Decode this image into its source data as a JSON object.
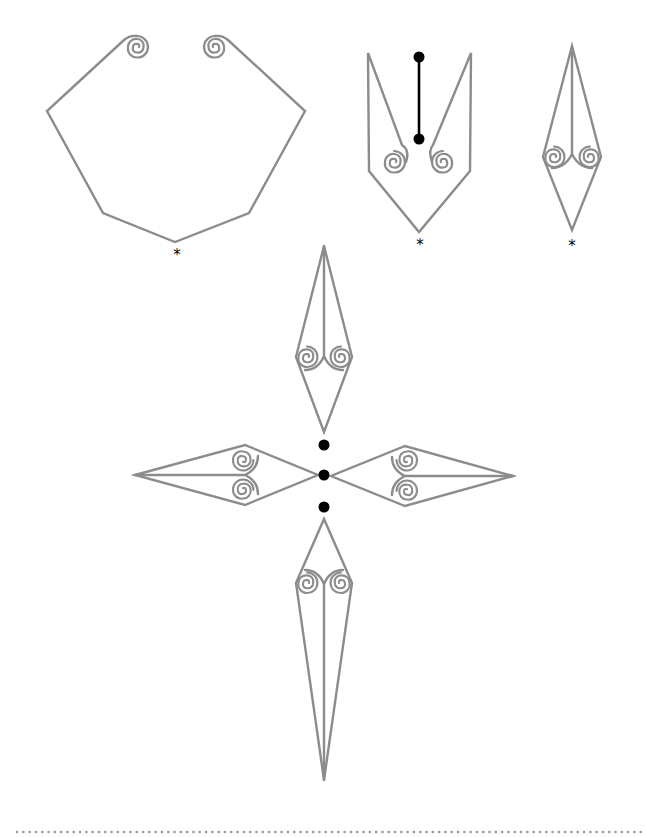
{
  "diagram": {
    "title": "",
    "stroke_color": "#8c8c8c",
    "dot_color": "#000000",
    "markers": {
      "fold_point_symbol": "*"
    },
    "figures": [
      {
        "id": "hexagon-with-scrolls",
        "label": "*",
        "description": "Open heptagonal outline with two inward spirals at the top"
      },
      {
        "id": "v-shape-with-scrolls",
        "label": "*",
        "description": "V-shaped outline with two spirals and a black pin line with dots"
      },
      {
        "id": "diamond-with-scrolls",
        "label": "*",
        "description": "Narrow diamond with central line and two spirals"
      },
      {
        "id": "cross-assembly",
        "label": "",
        "description": "Four scroll diamonds arranged in a cross around three black dots"
      }
    ],
    "footer": {
      "separator": "dotted-line"
    }
  }
}
